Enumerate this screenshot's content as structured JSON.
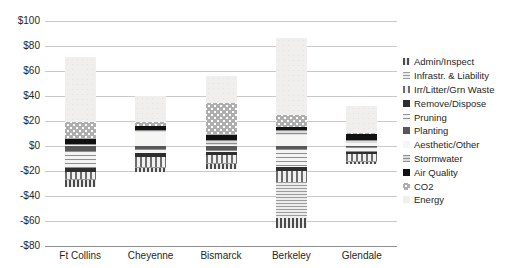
{
  "chart_data": {
    "type": "bar",
    "stacked": true,
    "title": "",
    "xlabel": "",
    "ylabel": "",
    "ylim": [
      -80,
      100
    ],
    "grid": true,
    "legend_position": "right",
    "currency_unit": "$ per tree",
    "categories": [
      "Ft Collins",
      "Cheyenne",
      "Bismarck",
      "Berkeley",
      "Glendale"
    ],
    "yticks": [
      {
        "label": "$100",
        "value": 100
      },
      {
        "label": "$80",
        "value": 80
      },
      {
        "label": "$60",
        "value": 60
      },
      {
        "label": "$40",
        "value": 40
      },
      {
        "label": "$20",
        "value": 20
      },
      {
        "label": "$0",
        "value": 0
      },
      {
        "label": "-$20",
        "value": -20
      },
      {
        "label": "-$40",
        "value": -40
      },
      {
        "label": "-$60",
        "value": -60
      },
      {
        "label": "-$80",
        "value": -80
      }
    ],
    "series": [
      {
        "name": "Admin/Inspect",
        "pattern": "vstripe-dark",
        "color": "#4a4a4a",
        "values": [
          -5.5,
          -3,
          -3.5,
          -8,
          -1.5
        ]
      },
      {
        "name": "Infrastr. & Liability",
        "pattern": "hlines-dense",
        "color": "#9b9b9b",
        "values": [
          -1,
          -1,
          -1,
          -29,
          -0.5
        ]
      },
      {
        "name": "Irr/Litter/Grn Waste",
        "pattern": "vstripe",
        "color": "#6d6d6d",
        "values": [
          -5.5,
          -8,
          -6,
          -8.5,
          -6
        ]
      },
      {
        "name": "Remove/Dispose",
        "pattern": "solid-dark",
        "color": "#2e2e2e",
        "values": [
          -3.5,
          -3,
          -3,
          -3,
          -1
        ]
      },
      {
        "name": "Pruning",
        "pattern": "hlines",
        "color": "#909090",
        "values": [
          -13.5,
          -3,
          -1.5,
          -15,
          -4
        ]
      },
      {
        "name": "Planting",
        "pattern": "solid-gray",
        "color": "#585858",
        "values": [
          -4,
          -2.5,
          -3,
          -2,
          -1
        ]
      },
      {
        "name": "Aesthetic/Other",
        "pattern": "light",
        "color": "#f6f6f4",
        "values": [
          0.5,
          11,
          1,
          8.5,
          2.5
        ]
      },
      {
        "name": "Stormwater",
        "pattern": "hlines-gray",
        "color": "#8f8f8f",
        "values": [
          1,
          2,
          4,
          4,
          2
        ]
      },
      {
        "name": "Air Quality",
        "pattern": "solid-black",
        "color": "#111111",
        "values": [
          4,
          3.2,
          3.5,
          2.5,
          5
        ]
      },
      {
        "name": "CO2",
        "pattern": "dots",
        "color": "#aeaeae",
        "values": [
          13.5,
          3.2,
          26,
          9.5,
          1
        ]
      },
      {
        "name": "Energy",
        "pattern": "very-light",
        "color": "#f0efed",
        "values": [
          52,
          21,
          21.5,
          62,
          21.5
        ]
      }
    ],
    "totals": {
      "benefits": [
        71,
        40.4,
        56,
        86.5,
        32
      ],
      "costs": [
        -33,
        -20.5,
        -18,
        -65.5,
        -14
      ]
    }
  }
}
